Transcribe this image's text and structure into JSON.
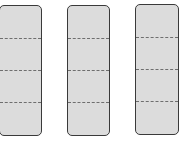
{
  "diagram": {
    "fill_color": "#dcdcdc",
    "border_color": "#3a3a3a",
    "divider_color": "#6e6e6e",
    "bars": [
      {
        "id": "bar-1",
        "parts": 4,
        "x": -1,
        "y": 5,
        "w": 43,
        "h": 131
      },
      {
        "id": "bar-2",
        "parts": 4,
        "x": 67,
        "y": 5,
        "w": 43,
        "h": 131
      },
      {
        "id": "bar-3",
        "parts": 4,
        "x": 135,
        "y": 4,
        "w": 44,
        "h": 131
      }
    ]
  }
}
